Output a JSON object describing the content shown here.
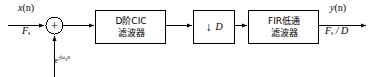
{
  "diagram": {
    "stroke_color": "#000000",
    "background_color": "#ffffff",
    "signals": {
      "input_name": "x(n)",
      "input_name_base": "x",
      "input_name_arg": "(n)",
      "input_rate": "F",
      "input_rate_sub": "s",
      "mixer_label_base": "e",
      "mixer_label_exp": "-jω",
      "mixer_label_exp_sub": "0",
      "mixer_label_exp_tail": "n",
      "output_name_base": "y",
      "output_name_arg": "(n)",
      "output_rate": "F",
      "output_rate_sub": "s",
      "output_rate_div": " / D"
    },
    "adder": {
      "symbol": "+",
      "name": "summing-junction"
    },
    "blocks": [
      {
        "id": "cic-filter",
        "line1": "D阶CIC",
        "line2": "滤波器"
      },
      {
        "id": "decimator",
        "arrow": "↓",
        "factor": "D"
      },
      {
        "id": "fir-filter",
        "line1": "FIR低通",
        "line2": "滤波器"
      }
    ]
  }
}
